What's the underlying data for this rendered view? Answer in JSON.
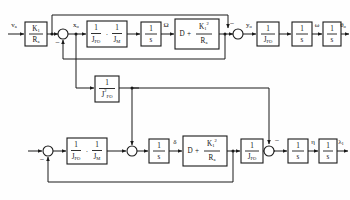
{
  "diagram": {
    "stroke_color": "#1a1a1a",
    "background_color": "#ffffff"
  },
  "signals": {
    "input_top": "v",
    "input_top_sub": "a",
    "x_o": "x",
    "x_o_sub": "o",
    "omega_cap": "Ω",
    "y_o": "y",
    "y_o_sub": "o",
    "omega": "ω",
    "theta_o": "θ",
    "theta_o_sub": "o",
    "delta": "δ",
    "eta": "η",
    "lambda": "λ",
    "lambda_sub": "1",
    "minus": "−"
  },
  "blocks": {
    "gain_k1_ra": {
      "num": "K",
      "num_sub": "1",
      "den": "R",
      "den_sub": "a"
    },
    "inv_jfo": {
      "num": "1",
      "den": "J",
      "den_sub": "FO"
    },
    "inv_jm": {
      "num": "1",
      "den": "J",
      "den_sub": "M"
    },
    "inv_jfo_sq": {
      "num": "1",
      "den": "J",
      "den_sup": "2",
      "den_sub": "FO"
    },
    "integrator": {
      "num": "1",
      "den": "s"
    },
    "damping": {
      "lead": "D",
      "op": "+",
      "num": "K",
      "num_sub": "1",
      "num_sup": "2",
      "den": "R",
      "den_sub": "a"
    },
    "product_op": "·"
  },
  "rows": {
    "top": {
      "label": "upper loop",
      "blocks": [
        "gain_k1_ra",
        "inv_jfo_times_inv_jm",
        "integrator",
        "damping",
        "inv_jfo",
        "integrator",
        "integrator"
      ]
    },
    "middle": {
      "label": "cross coupling",
      "blocks": [
        "inv_jfo_sq"
      ]
    },
    "bottom": {
      "label": "lower loop",
      "blocks": [
        "inv_jfo_times_inv_jm",
        "integrator",
        "damping",
        "inv_jfo",
        "integrator",
        "integrator"
      ]
    }
  }
}
